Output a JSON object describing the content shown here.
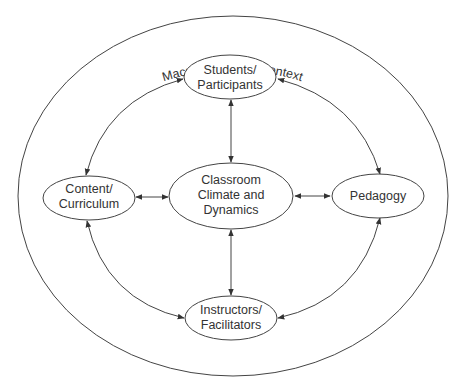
{
  "diagram": {
    "context_label": "Macro and Micro Context",
    "nodes": {
      "students": {
        "line1": "Students/",
        "line2": "Participants"
      },
      "content": {
        "line1": "Content/",
        "line2": "Curriculum"
      },
      "classroom": {
        "line1": "Classroom",
        "line2": "Climate and",
        "line3": "Dynamics"
      },
      "pedagogy": {
        "line1": "Pedagogy"
      },
      "instructors": {
        "line1": "Instructors/",
        "line2": "Facilitators"
      }
    },
    "edges": [
      {
        "from": "students",
        "to": "classroom",
        "type": "bidirectional"
      },
      {
        "from": "instructors",
        "to": "classroom",
        "type": "bidirectional"
      },
      {
        "from": "content",
        "to": "classroom",
        "type": "bidirectional"
      },
      {
        "from": "pedagogy",
        "to": "classroom",
        "type": "bidirectional"
      },
      {
        "from": "students",
        "to": "content",
        "type": "bidirectional-arc"
      },
      {
        "from": "students",
        "to": "pedagogy",
        "type": "bidirectional-arc"
      },
      {
        "from": "content",
        "to": "instructors",
        "type": "bidirectional-arc"
      },
      {
        "from": "pedagogy",
        "to": "instructors",
        "type": "bidirectional-arc"
      }
    ],
    "colors": {
      "line": "#444444",
      "text": "#333333",
      "background": "#ffffff"
    }
  }
}
